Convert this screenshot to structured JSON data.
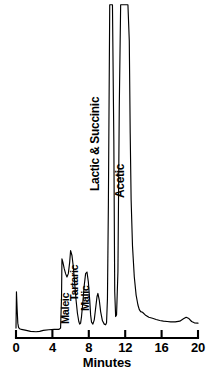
{
  "figure": {
    "type": "chromatogram",
    "background_color": "#ffffff",
    "trace_color": "#000000"
  },
  "axis": {
    "x_title": "Minutes",
    "tick_labels": [
      "0",
      "4",
      "8",
      "12",
      "16",
      "20"
    ],
    "tick_values": [
      0,
      4,
      8,
      12,
      16,
      20
    ]
  },
  "peak_labels": [
    {
      "text": "Maleic"
    },
    {
      "text": "Tartaric"
    },
    {
      "text": "Malic"
    },
    {
      "text": "Lactic & Succinic"
    },
    {
      "text": "Acetic"
    }
  ],
  "chart_data": {
    "type": "line",
    "title": "",
    "subtitle": "",
    "xlabel": "Minutes",
    "ylabel": "",
    "xlim": [
      0,
      20
    ],
    "ylim": [
      0,
      100
    ],
    "grid": false,
    "legend_position": "none",
    "x_ticks": [
      0,
      4,
      8,
      12,
      16,
      20
    ],
    "x_tick_labels": [
      "0",
      "4",
      "8",
      "12",
      "16",
      "20"
    ],
    "y_ticks": [],
    "y_tick_labels": [],
    "series": [
      {
        "name": "detector-signal",
        "color": "#000000",
        "x": [
          0.0,
          0.05,
          0.12,
          0.2,
          0.28,
          0.4,
          0.6,
          1.0,
          1.6,
          2.2,
          2.6,
          3.0,
          3.6,
          4.2,
          4.7,
          4.9,
          5.0,
          5.05,
          5.15,
          5.3,
          5.45,
          5.6,
          5.75,
          5.9,
          6.0,
          6.15,
          6.3,
          6.45,
          6.6,
          6.75,
          6.9,
          7.0,
          7.1,
          7.2,
          7.35,
          7.5,
          7.65,
          7.8,
          7.95,
          8.1,
          8.2,
          8.3,
          8.45,
          8.6,
          8.75,
          8.9,
          9.0,
          9.15,
          9.3,
          9.5,
          9.7,
          9.85,
          9.95,
          10.05,
          10.15,
          10.3,
          10.45,
          10.6,
          10.75,
          10.85,
          10.95,
          11.05,
          11.2,
          11.35,
          11.5,
          11.7,
          11.9,
          12.1,
          12.3,
          12.45,
          12.55,
          12.65,
          12.8,
          13.0,
          13.2,
          13.4,
          13.55,
          13.7,
          13.9,
          14.2,
          14.6,
          15.0,
          15.4,
          15.8,
          16.2,
          16.6,
          17.0,
          17.5,
          18.0,
          18.4,
          18.7,
          19.0,
          19.3,
          19.6,
          20.0
        ],
        "y": [
          3.0,
          14.0,
          9.0,
          4.5,
          3.2,
          2.8,
          2.6,
          2.4,
          2.0,
          1.9,
          2.0,
          2.3,
          2.5,
          2.6,
          2.6,
          3.0,
          12.0,
          24.0,
          23.0,
          21.0,
          19.5,
          18.5,
          19.5,
          23.0,
          26.5,
          25.0,
          21.5,
          16.5,
          11.5,
          7.5,
          5.0,
          4.2,
          4.5,
          6.5,
          11.0,
          16.0,
          19.5,
          20.0,
          17.0,
          11.5,
          7.0,
          4.8,
          4.2,
          5.5,
          9.0,
          12.5,
          13.5,
          11.5,
          8.0,
          5.2,
          4.2,
          4.0,
          4.6,
          12.0,
          40.0,
          101.0,
          101.0,
          101.0,
          60.0,
          14.0,
          6.5,
          7.0,
          20.0,
          70.0,
          101.0,
          101.0,
          101.0,
          101.0,
          101.0,
          90.0,
          62.0,
          42.0,
          28.0,
          18.5,
          13.0,
          10.0,
          8.6,
          8.0,
          7.8,
          7.0,
          6.3,
          6.0,
          5.6,
          5.3,
          5.1,
          5.0,
          4.9,
          4.9,
          5.1,
          5.8,
          6.3,
          5.9,
          5.0,
          4.6,
          4.5
        ]
      }
    ],
    "annotations": [
      {
        "label": "Maleic",
        "retention_time": 6.0,
        "orientation": "vertical"
      },
      {
        "label": "Tartaric",
        "retention_time": 7.8,
        "orientation": "vertical"
      },
      {
        "label": "Malic",
        "retention_time": 9.0,
        "orientation": "vertical"
      },
      {
        "label": "Lactic & Succinic",
        "retention_time": 10.5,
        "orientation": "vertical"
      },
      {
        "label": "Acetic",
        "retention_time": 12.0,
        "orientation": "vertical"
      }
    ]
  }
}
